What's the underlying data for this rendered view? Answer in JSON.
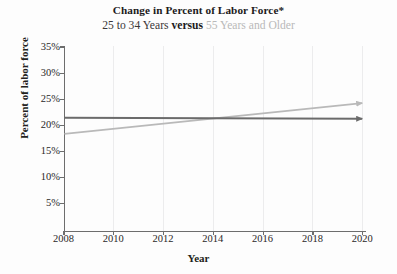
{
  "title": "Change in Percent of Labor Force*",
  "subtitle": {
    "part_a": "25 to 34 Years",
    "versus": "versus",
    "part_b": "55 Years and Older"
  },
  "axes": {
    "xlabel": "Year",
    "ylabel": "Percent of labor force",
    "ytick_labels": [
      "35%",
      "30%",
      "25%",
      "20%",
      "15%",
      "10%",
      "5%"
    ],
    "xtick_labels": [
      "2008",
      "2010",
      "2012",
      "2014",
      "2016",
      "2018",
      "2020"
    ]
  },
  "colors": {
    "series_young": "#6b6b6b",
    "series_older": "#b9b9b9",
    "axis": "#6d6d6d",
    "grid": "#ececed",
    "text": "#231f20"
  },
  "chart_data": {
    "type": "line",
    "title": "Change in Percent of Labor Force*",
    "subtitle": "25 to 34 Years versus 55 Years and Older",
    "xlabel": "Year",
    "ylabel": "Percent of labor force",
    "xlim": [
      2008,
      2020
    ],
    "ylim": [
      0,
      35
    ],
    "yticks": [
      5,
      10,
      15,
      20,
      25,
      30,
      35
    ],
    "xticks": [
      2008,
      2010,
      2012,
      2014,
      2016,
      2018,
      2020
    ],
    "ytick_suffix": "%",
    "grid": "vertical gridlines at each x tick",
    "legend": "none (series identified in subtitle by text color)",
    "annotations": [
      "both series terminate in arrowheads at 2020"
    ],
    "x": [
      2008,
      2020
    ],
    "series": [
      {
        "name": "25 to 34 Years",
        "color": "#6b6b6b",
        "values": [
          21.7,
          21.5
        ],
        "marker": "arrowhead at end"
      },
      {
        "name": "55 Years and Older",
        "color": "#b9b9b9",
        "values": [
          18.6,
          24.5
        ],
        "marker": "arrowhead at end"
      }
    ]
  }
}
